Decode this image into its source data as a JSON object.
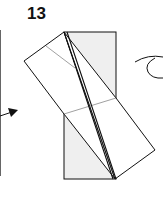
{
  "diagram": {
    "type": "origami-step",
    "step_number": "13",
    "colors": {
      "line": "#111111",
      "paper_back": "#efefef",
      "paper_front": "#ffffff",
      "crease": "#777777"
    }
  }
}
